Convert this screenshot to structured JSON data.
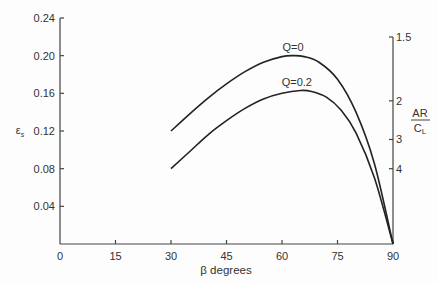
{
  "chart_data": {
    "type": "line",
    "title": "",
    "xlabel": "β degrees",
    "ylabel": "εs",
    "y2label_num": "AR",
    "y2label_den": "CL",
    "xlim": [
      0,
      90
    ],
    "ylim": [
      0,
      0.24
    ],
    "x_ticks": [
      "0",
      "15",
      "30",
      "45",
      "60",
      "75",
      "90"
    ],
    "y_ticks": [
      "0.04",
      "0.08",
      "0.12",
      "0.16",
      "0.20",
      "0.24"
    ],
    "y2_ticks": [
      {
        "label": "1.5",
        "y_value": 0.203
      },
      {
        "label": "2",
        "y_value": 0.152
      },
      {
        "label": "3",
        "y_value": 0.111
      },
      {
        "label": "4",
        "y_value": 0.08
      }
    ],
    "grid": false,
    "legend": "inline labels above curves",
    "series": [
      {
        "name": "Q=0",
        "x": [
          30,
          35,
          40,
          45,
          50,
          55,
          60,
          63,
          66,
          70,
          75,
          80,
          85,
          90
        ],
        "y": [
          0.12,
          0.138,
          0.155,
          0.17,
          0.183,
          0.193,
          0.199,
          0.2,
          0.199,
          0.193,
          0.175,
          0.14,
          0.085,
          0.0
        ]
      },
      {
        "name": "Q=0.2",
        "x": [
          30,
          35,
          40,
          45,
          50,
          55,
          60,
          65,
          68,
          72,
          76,
          80,
          85,
          90
        ],
        "y": [
          0.08,
          0.098,
          0.116,
          0.131,
          0.144,
          0.154,
          0.16,
          0.163,
          0.162,
          0.156,
          0.142,
          0.118,
          0.07,
          0.0
        ]
      }
    ]
  }
}
